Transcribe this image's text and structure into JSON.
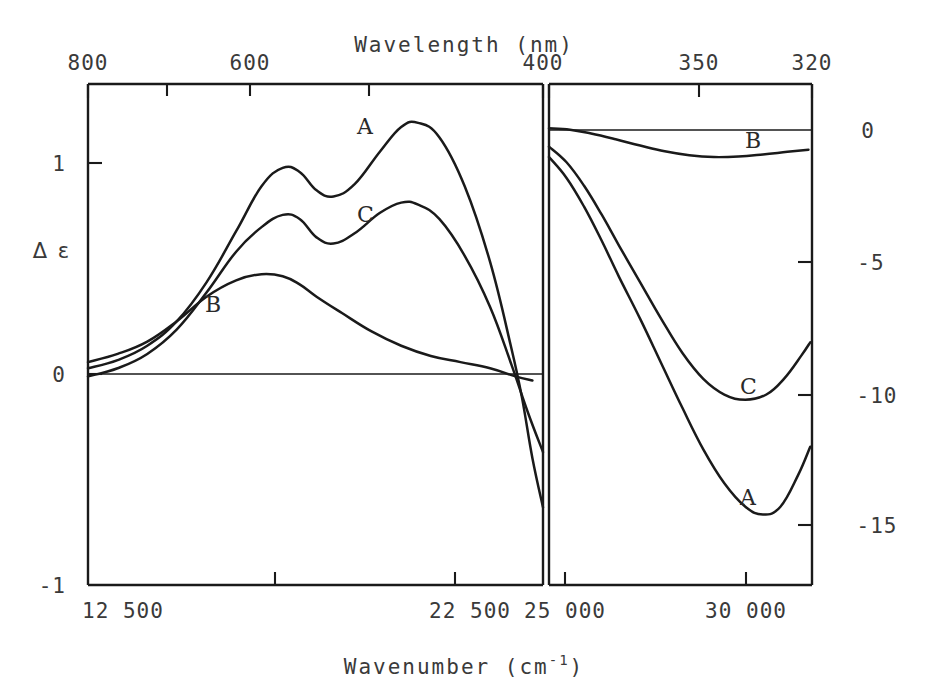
{
  "chart_data": {
    "type": "line",
    "title": "",
    "xlabel": "Wavenumber (cm⁻¹)",
    "xlabel_base": "Wavenumber (cm",
    "xlabel_sup": "-1",
    "xlabel_close": ")",
    "top_axis_label": "Wavelength (nm)",
    "ylabel": "Δ ε",
    "grid": false,
    "legend_position": "inline-curve-labels",
    "panels": [
      {
        "name": "left-panel",
        "x_axis": {
          "quantity": "wavenumber",
          "unit": "cm^-1",
          "range": [
            12500,
            23250
          ],
          "tick_values": [
            12500,
            22500
          ],
          "tick_labels": [
            "12 500",
            "22 500"
          ],
          "minor_tick_values": [
            17500,
            21500
          ]
        },
        "top_axis": {
          "quantity": "wavelength",
          "unit": "nm",
          "tick_values": [
            800,
            600,
            400
          ],
          "tick_labels": [
            "800",
            "600",
            "400"
          ],
          "minor_tick_values": [
            700,
            500
          ]
        },
        "y_axis": {
          "quantity": "delta epsilon",
          "range": [
            -1,
            1.45
          ],
          "tick_values": [
            1,
            0,
            -1
          ],
          "tick_labels": [
            "1",
            "0",
            "-1"
          ]
        },
        "series": [
          {
            "name": "A",
            "label": "A",
            "label_position": {
              "x": 357,
              "y": 134
            },
            "points": [
              [
                12500,
                0.06
              ],
              [
                13200,
                0.1
              ],
              [
                13900,
                0.17
              ],
              [
                14600,
                0.29
              ],
              [
                15300,
                0.48
              ],
              [
                16000,
                0.73
              ],
              [
                16600,
                0.95
              ],
              [
                17100,
                1.04
              ],
              [
                17500,
                1.02
              ],
              [
                17900,
                0.93
              ],
              [
                18300,
                0.9
              ],
              [
                18800,
                0.96
              ],
              [
                19400,
                1.12
              ],
              [
                19900,
                1.24
              ],
              [
                20300,
                1.26
              ],
              [
                20800,
                1.19
              ],
              [
                21400,
                0.95
              ],
              [
                22000,
                0.58
              ],
              [
                22500,
                0.16
              ],
              [
                22750,
                -0.08
              ],
              [
                23000,
                -0.38
              ],
              [
                23250,
                -0.62
              ]
            ]
          },
          {
            "name": "C",
            "label": "C",
            "label_position": {
              "x": 357,
              "y": 222
            },
            "points": [
              [
                12500,
                0.02
              ],
              [
                13200,
                0.06
              ],
              [
                13900,
                0.13
              ],
              [
                14600,
                0.25
              ],
              [
                15300,
                0.43
              ],
              [
                16000,
                0.63
              ],
              [
                16600,
                0.75
              ],
              [
                17100,
                0.81
              ],
              [
                17500,
                0.79
              ],
              [
                17900,
                0.7
              ],
              [
                18300,
                0.67
              ],
              [
                18800,
                0.72
              ],
              [
                19400,
                0.82
              ],
              [
                19900,
                0.87
              ],
              [
                20300,
                0.86
              ],
              [
                20800,
                0.79
              ],
              [
                21400,
                0.61
              ],
              [
                22000,
                0.36
              ],
              [
                22500,
                0.08
              ],
              [
                22900,
                -0.16
              ],
              [
                23250,
                -0.35
              ]
            ]
          },
          {
            "name": "B",
            "label": "B",
            "label_position": {
              "x": 205,
              "y": 312
            },
            "points": [
              [
                12500,
                0.09
              ],
              [
                13200,
                0.13
              ],
              [
                13900,
                0.19
              ],
              [
                14600,
                0.29
              ],
              [
                15300,
                0.41
              ],
              [
                16000,
                0.49
              ],
              [
                16600,
                0.52
              ],
              [
                17100,
                0.51
              ],
              [
                17500,
                0.47
              ],
              [
                17900,
                0.41
              ],
              [
                18500,
                0.33
              ],
              [
                19200,
                0.24
              ],
              [
                19900,
                0.17
              ],
              [
                20600,
                0.12
              ],
              [
                21300,
                0.09
              ],
              [
                22000,
                0.06
              ],
              [
                22600,
                0.02
              ],
              [
                23000,
                0.0
              ]
            ]
          }
        ]
      },
      {
        "name": "right-panel",
        "x_axis": {
          "quantity": "wavenumber",
          "unit": "cm^-1",
          "range": [
            24000,
            31500
          ],
          "tick_values": [
            25000,
            30000
          ],
          "tick_labels": [
            "25 000",
            "30 000"
          ]
        },
        "top_axis": {
          "quantity": "wavelength",
          "unit": "nm",
          "tick_values": [
            400,
            350,
            320
          ],
          "tick_labels": [
            "400",
            "350",
            "320"
          ]
        },
        "y_axis": {
          "quantity": "delta epsilon",
          "range": [
            -17.5,
            1.7
          ],
          "tick_values": [
            0,
            -5,
            -10,
            -15
          ],
          "tick_labels": [
            "0",
            "-5",
            "-10",
            "-15"
          ]
        },
        "series": [
          {
            "name": "B",
            "label": "B",
            "label_position": {
              "x": 745,
              "y": 148
            },
            "points": [
              [
                24000,
                0.0
              ],
              [
                24600,
                -0.05
              ],
              [
                25200,
                -0.2
              ],
              [
                25900,
                -0.42
              ],
              [
                26600,
                -0.66
              ],
              [
                27300,
                -0.88
              ],
              [
                28000,
                -1.03
              ],
              [
                28700,
                -1.1
              ],
              [
                29400,
                -1.08
              ],
              [
                30100,
                -1.0
              ],
              [
                30800,
                -0.9
              ],
              [
                31400,
                -0.82
              ]
            ]
          },
          {
            "name": "C",
            "label": "C",
            "label_position": {
              "x": 740,
              "y": 394
            },
            "points": [
              [
                24000,
                -0.7
              ],
              [
                24500,
                -1.3
              ],
              [
                25000,
                -2.2
              ],
              [
                25500,
                -3.3
              ],
              [
                26000,
                -4.5
              ],
              [
                26600,
                -5.9
              ],
              [
                27200,
                -7.3
              ],
              [
                27800,
                -8.6
              ],
              [
                28400,
                -9.6
              ],
              [
                29000,
                -10.2
              ],
              [
                29600,
                -10.4
              ],
              [
                30200,
                -10.2
              ],
              [
                30700,
                -9.6
              ],
              [
                31200,
                -8.7
              ],
              [
                31450,
                -8.2
              ]
            ]
          },
          {
            "name": "A",
            "label": "A",
            "label_position": {
              "x": 740,
              "y": 505
            },
            "points": [
              [
                24000,
                -1.1
              ],
              [
                24500,
                -1.9
              ],
              [
                25000,
                -3.0
              ],
              [
                25500,
                -4.3
              ],
              [
                26000,
                -5.7
              ],
              [
                26600,
                -7.3
              ],
              [
                27200,
                -9.0
              ],
              [
                27800,
                -10.7
              ],
              [
                28400,
                -12.3
              ],
              [
                29000,
                -13.6
              ],
              [
                29600,
                -14.5
              ],
              [
                30100,
                -14.8
              ],
              [
                30600,
                -14.5
              ],
              [
                31100,
                -13.3
              ],
              [
                31450,
                -12.2
              ]
            ]
          }
        ]
      }
    ]
  }
}
